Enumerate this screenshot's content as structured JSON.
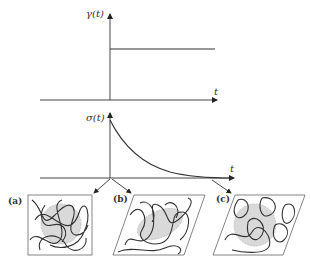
{
  "top_plot": {
    "y_label": "γ(t)",
    "x_label": "t",
    "description": "step strain applied at t=0"
  },
  "bottom_plot": {
    "y_label": "σ(t)",
    "x_label": "t",
    "description": "stress relaxation decaying exponentially"
  },
  "panels": [
    {
      "label": "(a)",
      "shape": "square",
      "description": "entangled polymer chains with gray ellipsoid, undeformed"
    },
    {
      "label": "(b)",
      "shape": "parallelogram",
      "description": "sheared network, stretched ellipsoid"
    },
    {
      "label": "(c)",
      "shape": "parallelogram",
      "description": "relaxed chains in sheared box, spherical region"
    }
  ],
  "colors": {
    "line": "#3a3a3a",
    "blob_fill": "#d9d9d9",
    "blob_stroke": "#bbbbbb"
  }
}
